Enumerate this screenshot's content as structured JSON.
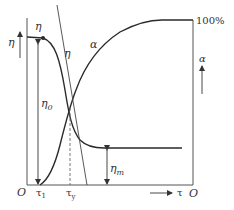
{
  "diagram": {
    "type": "viscosity-vs-stress / structure-degree plot",
    "colors": {
      "line": "#2a2a2a",
      "axis": "#555555",
      "background": "#ffffff"
    },
    "labels": {
      "eta_axis": "η",
      "alpha_axis": "α",
      "eta_curve": "η",
      "eta_top": "η",
      "alpha_curve": "α",
      "eta0": "η",
      "eta0_sub": "0",
      "etam": "η",
      "etam_sub": "m",
      "hundred_percent": "100%",
      "origin_left": "O",
      "origin_right": "O",
      "tau1": "τ",
      "tau1_sub": "1",
      "tauy": "τ",
      "tauy_sub": "y",
      "tau_axis": "τ"
    }
  }
}
